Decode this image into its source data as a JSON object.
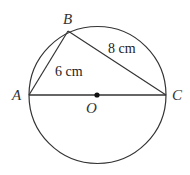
{
  "figure": {
    "type": "circle with inscribed right triangle",
    "circle": {
      "center": "O",
      "diameter": "AC"
    },
    "points": {
      "A": {
        "label": "A"
      },
      "B": {
        "label": "B"
      },
      "C": {
        "label": "C"
      },
      "O": {
        "label": "O"
      }
    },
    "segments": {
      "AB": {
        "length": "6 cm"
      },
      "BC": {
        "length": "8 cm"
      },
      "AC": {
        "length": ""
      }
    },
    "colors": {
      "stroke": "#333333",
      "background": "#ffffff"
    }
  }
}
